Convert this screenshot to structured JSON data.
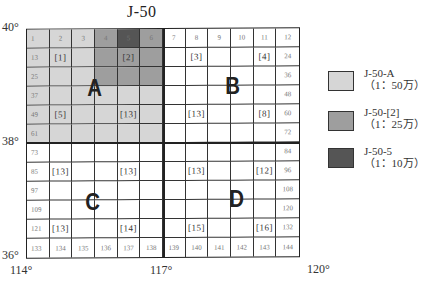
{
  "title": "J-50",
  "colors": {
    "scale_1_50wan": "#d6d6d6",
    "scale_1_25wan": "#9e9e9e",
    "scale_1_10wan": "#555555",
    "grid_line": "#222222"
  },
  "axes": {
    "latitudes": [
      "40°",
      "38°",
      "36°"
    ],
    "longitudes": [
      "114°",
      "117°",
      "120°"
    ]
  },
  "quadrants": [
    "A",
    "B",
    "C",
    "D"
  ],
  "grid": {
    "rows": [
      [
        {
          "t": "1",
          "f": "light"
        },
        {
          "t": "2",
          "f": "light"
        },
        {
          "t": "3",
          "f": "light"
        },
        {
          "t": "4",
          "f": "medium"
        },
        {
          "t": "5",
          "f": "dark"
        },
        {
          "t": "6",
          "f": "medium"
        },
        {
          "t": "7"
        },
        {
          "t": "8"
        },
        {
          "t": "9"
        },
        {
          "t": "10"
        },
        {
          "t": "11"
        },
        {
          "t": "12"
        }
      ],
      [
        {
          "t": "13",
          "f": "light"
        },
        {
          "t": "[1]",
          "b": 1,
          "f": "light"
        },
        {
          "t": "",
          "f": "light"
        },
        {
          "t": "",
          "f": "medium"
        },
        {
          "t": "[2]",
          "b": 1,
          "f": "medium"
        },
        {
          "t": "",
          "f": "medium"
        },
        {
          "t": ""
        },
        {
          "t": "[3]",
          "b": 1
        },
        {
          "t": ""
        },
        {
          "t": ""
        },
        {
          "t": "[4]",
          "b": 1
        },
        {
          "t": "24"
        }
      ],
      [
        {
          "t": "25",
          "f": "light"
        },
        {
          "t": "",
          "f": "light"
        },
        {
          "t": "",
          "f": "light"
        },
        {
          "t": "",
          "f": "medium"
        },
        {
          "t": "",
          "f": "medium"
        },
        {
          "t": "",
          "f": "medium"
        },
        {
          "t": ""
        },
        {
          "t": ""
        },
        {
          "t": ""
        },
        {
          "t": ""
        },
        {
          "t": ""
        },
        {
          "t": "36"
        }
      ],
      [
        {
          "t": "37",
          "f": "light"
        },
        {
          "t": "",
          "f": "light"
        },
        {
          "t": "",
          "f": "light"
        },
        {
          "t": "",
          "f": "light"
        },
        {
          "t": "",
          "f": "light"
        },
        {
          "t": "",
          "f": "light"
        },
        {
          "t": ""
        },
        {
          "t": ""
        },
        {
          "t": ""
        },
        {
          "t": ""
        },
        {
          "t": ""
        },
        {
          "t": "48"
        }
      ],
      [
        {
          "t": "49",
          "f": "light"
        },
        {
          "t": "[5]",
          "b": 1,
          "f": "light"
        },
        {
          "t": "",
          "f": "light"
        },
        {
          "t": "",
          "f": "light"
        },
        {
          "t": "[13]",
          "b": 1,
          "f": "light"
        },
        {
          "t": "",
          "f": "light"
        },
        {
          "t": ""
        },
        {
          "t": "[13]",
          "b": 1
        },
        {
          "t": ""
        },
        {
          "t": ""
        },
        {
          "t": "[8]",
          "b": 1
        },
        {
          "t": "60"
        }
      ],
      [
        {
          "t": "61",
          "f": "light"
        },
        {
          "t": "",
          "f": "light"
        },
        {
          "t": "",
          "f": "light"
        },
        {
          "t": "",
          "f": "light"
        },
        {
          "t": "",
          "f": "light"
        },
        {
          "t": "",
          "f": "light"
        },
        {
          "t": ""
        },
        {
          "t": ""
        },
        {
          "t": ""
        },
        {
          "t": ""
        },
        {
          "t": ""
        },
        {
          "t": "72"
        }
      ],
      [
        {
          "t": "73"
        },
        {
          "t": ""
        },
        {
          "t": ""
        },
        {
          "t": ""
        },
        {
          "t": ""
        },
        {
          "t": ""
        },
        {
          "t": ""
        },
        {
          "t": ""
        },
        {
          "t": ""
        },
        {
          "t": ""
        },
        {
          "t": ""
        },
        {
          "t": "84"
        }
      ],
      [
        {
          "t": "85"
        },
        {
          "t": "[13]",
          "b": 1
        },
        {
          "t": ""
        },
        {
          "t": ""
        },
        {
          "t": "[13]",
          "b": 1
        },
        {
          "t": ""
        },
        {
          "t": ""
        },
        {
          "t": "[13]",
          "b": 1
        },
        {
          "t": ""
        },
        {
          "t": ""
        },
        {
          "t": "[12]",
          "b": 1
        },
        {
          "t": "96"
        }
      ],
      [
        {
          "t": "97"
        },
        {
          "t": ""
        },
        {
          "t": ""
        },
        {
          "t": ""
        },
        {
          "t": ""
        },
        {
          "t": ""
        },
        {
          "t": ""
        },
        {
          "t": ""
        },
        {
          "t": ""
        },
        {
          "t": ""
        },
        {
          "t": ""
        },
        {
          "t": "108"
        }
      ],
      [
        {
          "t": "109"
        },
        {
          "t": ""
        },
        {
          "t": ""
        },
        {
          "t": ""
        },
        {
          "t": ""
        },
        {
          "t": ""
        },
        {
          "t": ""
        },
        {
          "t": ""
        },
        {
          "t": ""
        },
        {
          "t": ""
        },
        {
          "t": ""
        },
        {
          "t": "120"
        }
      ],
      [
        {
          "t": "121"
        },
        {
          "t": "[13]",
          "b": 1
        },
        {
          "t": ""
        },
        {
          "t": ""
        },
        {
          "t": "[14]",
          "b": 1
        },
        {
          "t": ""
        },
        {
          "t": ""
        },
        {
          "t": "[15]",
          "b": 1
        },
        {
          "t": ""
        },
        {
          "t": ""
        },
        {
          "t": "[16]",
          "b": 1
        },
        {
          "t": "132"
        }
      ],
      [
        {
          "t": "133"
        },
        {
          "t": "134"
        },
        {
          "t": "135"
        },
        {
          "t": "136"
        },
        {
          "t": "137"
        },
        {
          "t": "138"
        },
        {
          "t": "139"
        },
        {
          "t": "140"
        },
        {
          "t": "141"
        },
        {
          "t": "142"
        },
        {
          "t": "143"
        },
        {
          "t": "144"
        }
      ]
    ]
  },
  "legend": [
    {
      "name": "J-50-A",
      "scale": "（1：50万）",
      "fill": "light"
    },
    {
      "name": "J-50-[2]",
      "scale": "（1：25万）",
      "fill": "medium"
    },
    {
      "name": "J-50-5",
      "scale": "（1：10万）",
      "fill": "dark"
    }
  ]
}
